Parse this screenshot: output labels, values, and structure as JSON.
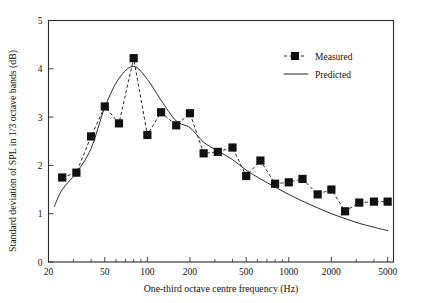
{
  "chart_data": {
    "type": "line",
    "title": "",
    "xlabel": "One-third octave centre frequency (Hz)",
    "ylabel": "Standard deviation of SPL in 1/3 octave bands (dB)",
    "xscale": "log",
    "yscale": "linear",
    "xlim": [
      20,
      5500
    ],
    "ylim": [
      0,
      5
    ],
    "grid": false,
    "legend_position": "upper-right",
    "x_tick_labels": [
      "20",
      "50",
      "100",
      "200",
      "500",
      "1000",
      "2000",
      "5000"
    ],
    "x_tick_values": [
      20,
      50,
      100,
      200,
      500,
      1000,
      2000,
      5000
    ],
    "x_minor_ticks": [
      30,
      40,
      60,
      70,
      80,
      90,
      300,
      400,
      600,
      700,
      800,
      900,
      3000,
      4000
    ],
    "y_tick_labels": [
      "0",
      "1",
      "2",
      "3",
      "4",
      "5"
    ],
    "y_tick_values": [
      0,
      1,
      2,
      3,
      4,
      5
    ],
    "series": [
      {
        "name": "Measured",
        "style": "dashed-line-with-square-markers",
        "marker": "square",
        "color": "#111111",
        "x": [
          25,
          31.5,
          40,
          50,
          63,
          80,
          100,
          125,
          160,
          200,
          250,
          315,
          400,
          500,
          630,
          800,
          1000,
          1250,
          1600,
          2000,
          2500,
          3150,
          4000,
          5000
        ],
        "values": [
          1.75,
          1.85,
          2.6,
          3.22,
          2.87,
          4.22,
          2.63,
          3.1,
          2.83,
          3.08,
          2.25,
          2.28,
          2.37,
          1.78,
          2.1,
          1.62,
          1.65,
          1.72,
          1.4,
          1.5,
          1.05,
          1.23,
          1.25,
          1.25
        ]
      },
      {
        "name": "Predicted",
        "style": "solid-line",
        "marker": "none",
        "color": "#2b2b2b",
        "x": [
          22,
          25,
          31.5,
          40,
          50,
          63,
          80,
          100,
          125,
          160,
          200,
          250,
          315,
          400,
          500,
          630,
          800,
          1000,
          1250,
          1600,
          2000,
          2500,
          3150,
          4000,
          5000
        ],
        "values": [
          1.15,
          1.5,
          1.85,
          2.35,
          3.2,
          3.8,
          4.05,
          3.78,
          3.35,
          2.92,
          2.78,
          2.48,
          2.3,
          2.12,
          1.9,
          1.72,
          1.55,
          1.4,
          1.26,
          1.12,
          1.0,
          0.9,
          0.8,
          0.72,
          0.65
        ]
      }
    ],
    "legend": [
      {
        "label": "Measured",
        "swatch": "dashed-square"
      },
      {
        "label": "Predicted",
        "swatch": "solid-line"
      }
    ]
  }
}
